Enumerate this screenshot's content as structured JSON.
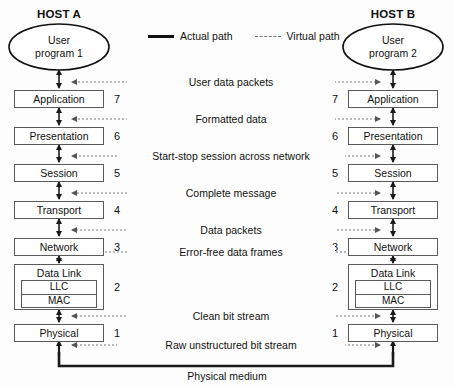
{
  "diagram": {
    "title_left": "HOST A",
    "title_right": "HOST B",
    "legend": {
      "actual_path": "Actual path",
      "virtual_path": "Virtual path",
      "actual_icon": "solid-line-icon",
      "virtual_icon": "dotted-line-icon"
    },
    "endpoints": {
      "left": {
        "line1": "User",
        "line2": "program 1"
      },
      "right": {
        "line1": "User",
        "line2": "program 2"
      }
    },
    "layers": [
      {
        "number": "7",
        "name": "Application",
        "path_label": "User data packets"
      },
      {
        "number": "6",
        "name": "Presentation",
        "path_label": "Formatted data"
      },
      {
        "number": "5",
        "name": "Session",
        "path_label": "Start-stop session across network"
      },
      {
        "number": "4",
        "name": "Transport",
        "path_label": "Complete message"
      },
      {
        "number": "3",
        "name": "Network",
        "path_label": "Data packets"
      },
      {
        "number": "2",
        "name": "Data Link",
        "path_label": "Error-free data frames",
        "sublayers": [
          "LLC",
          "MAC"
        ]
      },
      {
        "number": "1",
        "name": "Physical",
        "path_label": "Clean bit stream"
      }
    ],
    "bottom_path_label": "Raw unstructured bit stream",
    "medium_label": "Physical medium",
    "colors": {
      "stroke": "#1a1a1a",
      "box_border": "#5a5a5a",
      "virtual": "#777777",
      "background": "#fdfdfd"
    }
  }
}
